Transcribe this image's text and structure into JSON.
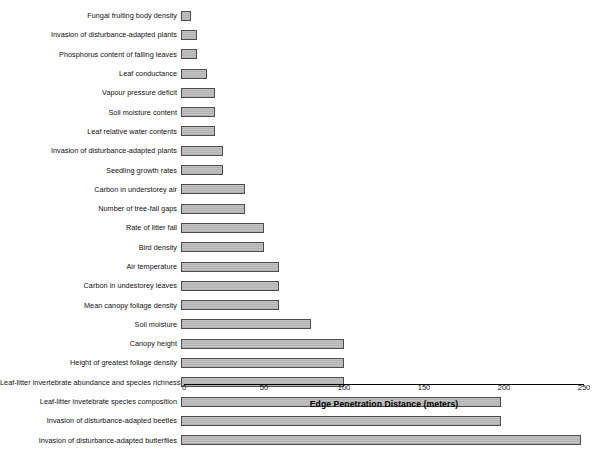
{
  "chart_data": {
    "type": "bar",
    "orientation": "horizontal",
    "title": "",
    "xlabel": "Edge Penetration Distance (meters)",
    "ylabel": "",
    "xlim": [
      0,
      250
    ],
    "xticks": [
      0,
      50,
      100,
      150,
      200,
      250
    ],
    "xtick_labels": [
      "0",
      "50",
      "100",
      "150",
      "200",
      "250"
    ],
    "grid": false,
    "legend": "none",
    "bar_face_color": "#bfbfbf",
    "bar_edge_color": "#4d4d4d",
    "categories": [
      "Fungal fruiting body density",
      "Invasion of disturbance-adapted plants",
      "Phosphorus content of falling leaves",
      "Leaf conductance",
      "Vapour pressure deficit",
      "Soil moisture content",
      "Leaf relative water contents",
      "Invasion of disturbance-adapted plants",
      "Seedling growth rates",
      "Carbon in understorey air",
      "Number of tree-fall gaps",
      "Rate of litter fall",
      "Bird density",
      "Air temperature",
      "Carbon in undestorey leaves",
      "Mean canopy foliage density",
      "Soil moisture",
      "Canopy height",
      "Height of greatest foliage density",
      "Leaf-litter invertebrate abundance and species richness",
      "Leaf-litter invetebrate species composition",
      "Invasion of disturbance-adapted beetles",
      "Invasion of disturbance-adapted butterflies"
    ],
    "values": [
      6,
      10,
      10,
      16,
      21,
      21,
      21,
      26,
      26,
      40,
      40,
      52,
      52,
      61,
      61,
      61,
      81,
      102,
      102,
      102,
      200,
      200,
      250
    ]
  }
}
